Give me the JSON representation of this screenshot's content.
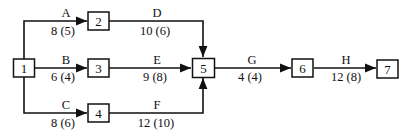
{
  "diagram": {
    "type": "activity-on-arrow network",
    "nodes": [
      {
        "id": "1",
        "label": "1"
      },
      {
        "id": "2",
        "label": "2"
      },
      {
        "id": "3",
        "label": "3"
      },
      {
        "id": "4",
        "label": "4"
      },
      {
        "id": "5",
        "label": "5"
      },
      {
        "id": "6",
        "label": "6"
      },
      {
        "id": "7",
        "label": "7"
      }
    ],
    "edges": [
      {
        "activity": "A",
        "from": "1",
        "to": "2",
        "duration": "8 (5)"
      },
      {
        "activity": "B",
        "from": "1",
        "to": "3",
        "duration": "6 (4)"
      },
      {
        "activity": "C",
        "from": "1",
        "to": "4",
        "duration": "8 (6)"
      },
      {
        "activity": "D",
        "from": "2",
        "to": "5",
        "duration": "10 (6)"
      },
      {
        "activity": "E",
        "from": "3",
        "to": "5",
        "duration": "9 (8)"
      },
      {
        "activity": "F",
        "from": "4",
        "to": "5",
        "duration": "12 (10)"
      },
      {
        "activity": "G",
        "from": "5",
        "to": "6",
        "duration": "4 (4)"
      },
      {
        "activity": "H",
        "from": "6",
        "to": "7",
        "duration": "12 (8)"
      }
    ]
  }
}
